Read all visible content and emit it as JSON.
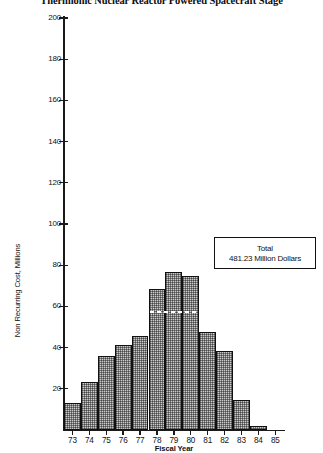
{
  "chart_data": {
    "type": "bar",
    "title": "Thermionic Nuclear Reactor Powered Spacecraft Stage",
    "xlabel": "Fiscal Year",
    "ylabel": "Non Recurring Cost, Millions",
    "categories": [
      "73",
      "74",
      "75",
      "76",
      "77",
      "78",
      "79",
      "80",
      "81",
      "82",
      "83",
      "84",
      "85"
    ],
    "values": [
      13.0,
      23.5,
      36.0,
      41.5,
      45.5,
      68.5,
      76.5,
      75.0,
      47.5,
      38.5,
      14.5,
      2.0,
      0.0
    ],
    "ylim": [
      0,
      200
    ],
    "yticks": [
      20,
      40,
      60,
      80,
      100,
      120,
      140,
      160,
      180,
      200
    ],
    "ytick_labels": [
      "20",
      "40",
      "60",
      "80",
      "100",
      "120",
      "140",
      "160",
      "180",
      "200"
    ],
    "grid": false,
    "legend_position": "none",
    "annotations": [
      {
        "name": "total-box",
        "line1": "Total",
        "line2": "481.23 Million Dollars"
      },
      {
        "name": "marker-line",
        "description": "dashed white horizontal line across the three tallest bars",
        "value": 58.0,
        "spans_categories": [
          "78",
          "79",
          "80"
        ]
      }
    ],
    "colors": {
      "bar_fill": "#c9c9c9",
      "bar_edge": "#111111",
      "axis": "#1a1a1a",
      "text": "#111111",
      "background": "#ffffff"
    }
  }
}
